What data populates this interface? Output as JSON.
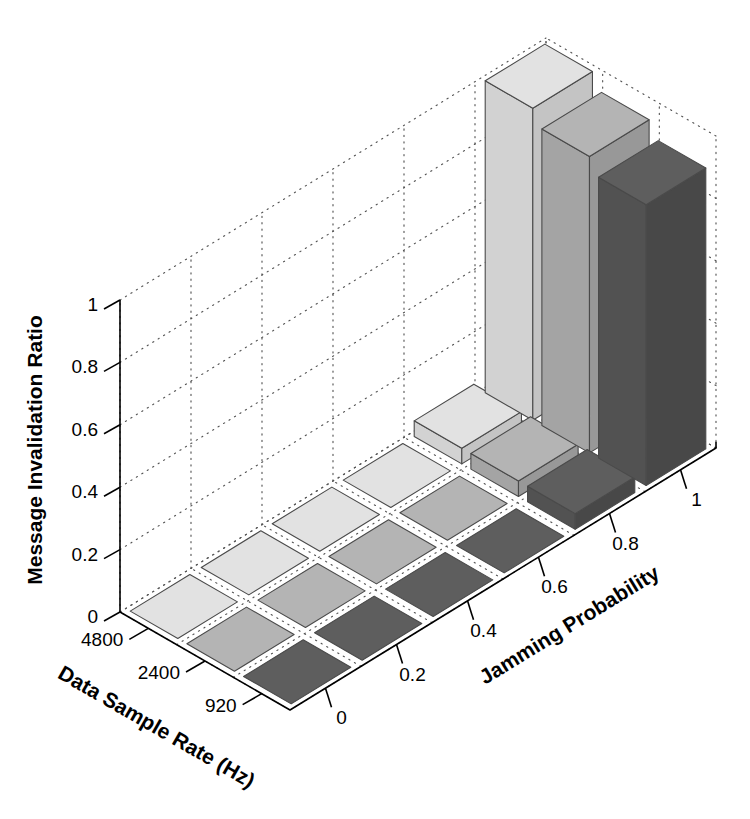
{
  "chart_data": {
    "type": "bar",
    "subtype": "bar3",
    "title": "",
    "xlabel": "Jamming Probability",
    "ylabel": "Data Sample Rate (Hz)",
    "zlabel": "Message Invalidation Ratio",
    "x_categories": [
      "0",
      "0.2",
      "0.4",
      "0.6",
      "0.8",
      "1"
    ],
    "y_categories": [
      "4800",
      "2400",
      "920"
    ],
    "zlim": [
      0,
      1
    ],
    "z_ticks": [
      "0",
      "0.2",
      "0.4",
      "0.6",
      "0.8",
      "1"
    ],
    "grid": true,
    "legend": "none",
    "series": [
      {
        "name": "4800",
        "color": "#e2e2e2",
        "values": [
          0,
          0,
          0,
          0,
          0.05,
          1.0
        ]
      },
      {
        "name": "2400",
        "color": "#b4b4b4",
        "values": [
          0,
          0,
          0,
          0,
          0.05,
          0.95
        ]
      },
      {
        "name": "920",
        "color": "#5e5e5e",
        "values": [
          0,
          0,
          0,
          0,
          0.05,
          0.9
        ]
      }
    ]
  },
  "axes": {
    "z": {
      "label": "Message Invalidation Ratio",
      "ticks": [
        {
          "value": 1,
          "label": "1"
        },
        {
          "value": 0.8,
          "label": "0.8"
        },
        {
          "value": 0.6,
          "label": "0.6"
        },
        {
          "value": 0.4,
          "label": "0.4"
        },
        {
          "value": 0.2,
          "label": "0.2"
        },
        {
          "value": 0,
          "label": "0"
        }
      ]
    },
    "y": {
      "label": "Data Sample Rate (Hz)",
      "ticks": [
        {
          "label": "4800"
        },
        {
          "label": "2400"
        },
        {
          "label": "920"
        }
      ]
    },
    "x": {
      "label": "Jamming Probability",
      "ticks": [
        {
          "label": "0"
        },
        {
          "label": "0.2"
        },
        {
          "label": "0.4"
        },
        {
          "label": "0.6"
        },
        {
          "label": "0.8"
        },
        {
          "label": "1"
        }
      ]
    }
  },
  "colors": {
    "background": "#ffffff",
    "axis_line": "#000000",
    "grid_dots": "#555555",
    "bar_edge": "#4a4a4a",
    "row_4800": "#e2e2e2",
    "row_2400": "#b4b4b4",
    "row_920": "#5e5e5e",
    "row_4800_left": "#d2d2d2",
    "row_4800_right": "#c4c4c4",
    "row_2400_left": "#a4a4a4",
    "row_2400_right": "#989898",
    "row_920_left": "#525252",
    "row_920_right": "#484848"
  }
}
